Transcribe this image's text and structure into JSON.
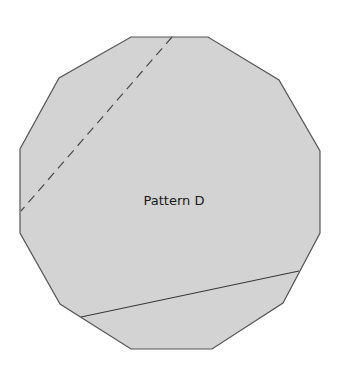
{
  "diagram": {
    "label": "Pattern D",
    "colors": {
      "fill": "#d3d3d3",
      "stroke": "#555555",
      "line": "#3a3a3a",
      "background": "#ffffff",
      "text": "#1a1a1a"
    },
    "shape": {
      "type": "dodecagon",
      "vertices": [
        [
          131,
          37
        ],
        [
          208,
          37
        ],
        [
          279,
          80
        ],
        [
          320,
          151
        ],
        [
          320,
          233
        ],
        [
          283,
          303
        ],
        [
          212,
          349
        ],
        [
          131,
          349
        ],
        [
          60,
          304
        ],
        [
          20,
          233
        ],
        [
          20,
          149
        ],
        [
          59,
          78
        ]
      ]
    },
    "lines": [
      {
        "style": "dashed",
        "from": [
          172,
          37
        ],
        "to": [
          21,
          211
        ]
      },
      {
        "style": "solid",
        "from": [
          81,
          317
        ],
        "to": [
          299,
          271
        ]
      }
    ]
  }
}
